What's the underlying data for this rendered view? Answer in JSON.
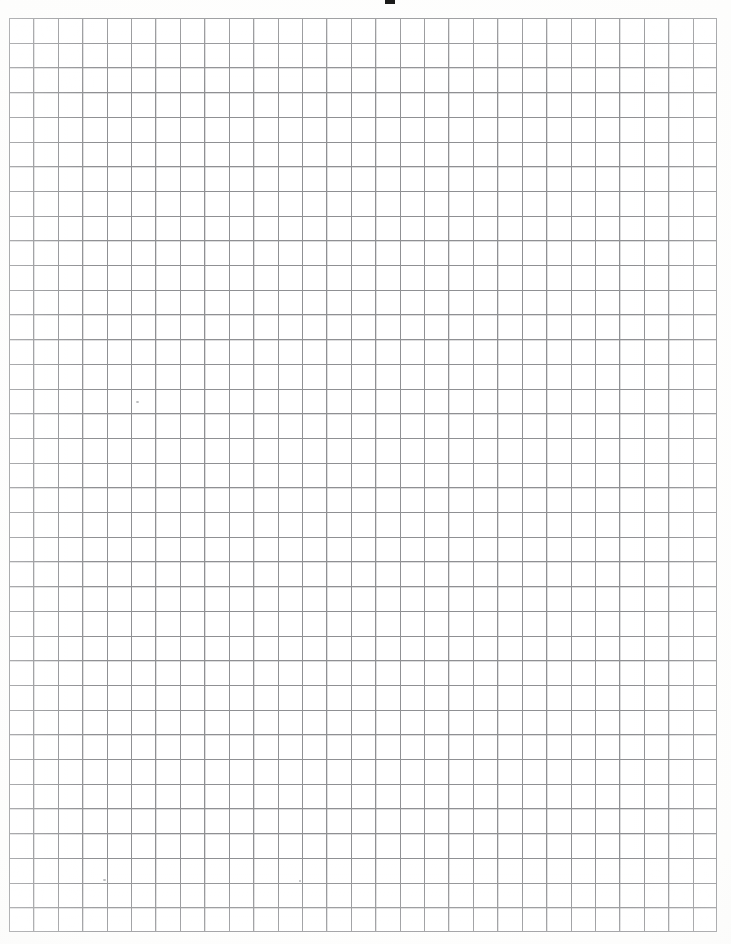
{
  "document": {
    "title": "Graph Paper Sheet",
    "kind": "scanned-grid-paper",
    "description": "Blank scanned sheet of square-ruled graph paper",
    "background_color": "#fdfdfd",
    "paper_color": "#ffffff"
  },
  "grid": {
    "label": "graph-paper-grid",
    "columns": 29,
    "rows": 37,
    "cell_width_px": 24.414,
    "cell_height_px": 24.703,
    "left_px": 9,
    "top_px": 18,
    "width_px": 708,
    "height_px": 914,
    "line_color": "#8f9093",
    "line_width_px": 1,
    "border_color": "#8f9093"
  },
  "artifacts": {
    "top_mark": {
      "label": "cropped-ink-mark",
      "left_px": 385,
      "top_px": 0,
      "width_px": 10,
      "height_px": 4,
      "color": "#1a1a1a"
    },
    "specks": [
      {
        "label": "pencil-speck",
        "left_px": 136,
        "top_px": 401
      },
      {
        "label": "pencil-speck",
        "left_px": 103,
        "top_px": 879
      },
      {
        "label": "pencil-speck",
        "left_px": 299,
        "top_px": 880
      }
    ]
  },
  "chart_data": {
    "type": "table",
    "title": "",
    "xlabel": "",
    "ylabel": "",
    "categories": [],
    "values": [],
    "grid": true,
    "legend": "none",
    "note": "Empty grid paper: no plotted data, no axis tick labels, no legend entries."
  }
}
